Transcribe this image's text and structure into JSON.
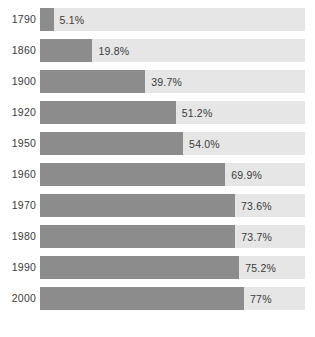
{
  "chart_data": {
    "type": "bar",
    "orientation": "horizontal",
    "title": "",
    "subtitle": "",
    "xlabel": "",
    "ylabel": "",
    "xlim": [
      0,
      100
    ],
    "grid": false,
    "legend": null,
    "unit": "%",
    "categories": [
      "1790",
      "1860",
      "1900",
      "1920",
      "1950",
      "1960",
      "1970",
      "1980",
      "1990",
      "2000"
    ],
    "values": [
      5.1,
      19.8,
      39.7,
      51.2,
      54.0,
      69.9,
      73.6,
      73.7,
      75.2,
      77
    ],
    "value_labels": [
      "5.1%",
      "19.8%",
      "39.7%",
      "51.2%",
      "54.0%",
      "69.9%",
      "73.6%",
      "73.7%",
      "75.2%",
      "77%"
    ],
    "series": [
      {
        "name": "",
        "values": [
          5.1,
          19.8,
          39.7,
          51.2,
          54.0,
          69.9,
          73.6,
          73.7,
          75.2,
          77
        ]
      }
    ]
  },
  "colors": {
    "background": "#ffffff",
    "bar_fill": "#8c8c8c",
    "bar_track": "#e6e6e6",
    "label_text": "#3a3a3a"
  }
}
